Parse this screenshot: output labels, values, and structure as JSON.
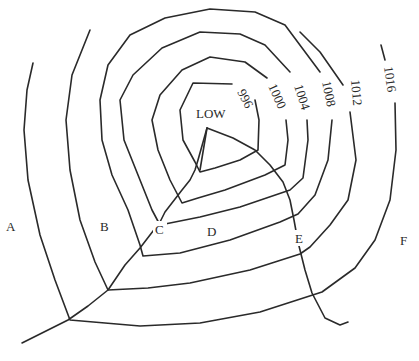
{
  "diagram": {
    "type": "weather-map-isobars",
    "center_label": "LOW",
    "isobars": [
      {
        "value": "996",
        "label": "996"
      },
      {
        "value": "1000",
        "label": "1000"
      },
      {
        "value": "1004",
        "label": "1004"
      },
      {
        "value": "1008",
        "label": "1008"
      },
      {
        "value": "1012",
        "label": "1012"
      },
      {
        "value": "1016",
        "label": "1016"
      }
    ],
    "points": [
      {
        "id": "A",
        "label": "A"
      },
      {
        "id": "B",
        "label": "B"
      },
      {
        "id": "C",
        "label": "C"
      },
      {
        "id": "D",
        "label": "D"
      },
      {
        "id": "E",
        "label": "E"
      },
      {
        "id": "F",
        "label": "F"
      }
    ],
    "colors": {
      "line": "#2a2a2a",
      "background": "#ffffff"
    }
  }
}
